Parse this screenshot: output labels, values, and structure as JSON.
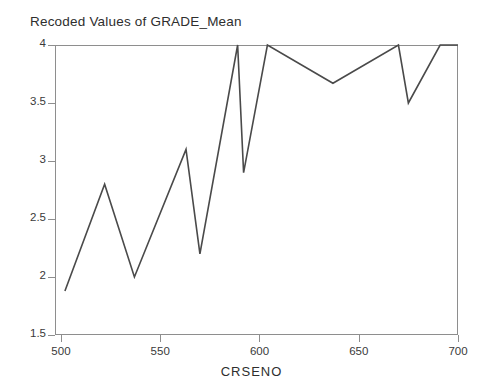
{
  "chart_data": {
    "type": "line",
    "title": "Recoded Values of GRADE_Mean",
    "xlabel": "CRSENO",
    "ylabel": "",
    "xlim": [
      497,
      700
    ],
    "ylim": [
      1.5,
      4.0
    ],
    "grid": false,
    "legend": false,
    "legend_position": "none",
    "line_color": "#4a4a4a",
    "xticks": [
      500,
      550,
      600,
      650,
      700
    ],
    "xtick_labels": [
      "500",
      "550",
      "600",
      "650",
      "700"
    ],
    "yticks": [
      1.5,
      2,
      2.5,
      3,
      3.5,
      4
    ],
    "ytick_labels": [
      "1.5",
      "2",
      "2.5",
      "3",
      "3.5",
      "4"
    ],
    "x": [
      502,
      522,
      537,
      563,
      570,
      589,
      592,
      604,
      637,
      670,
      675,
      691,
      700
    ],
    "y": [
      1.88,
      2.8,
      2.0,
      3.1,
      2.2,
      4.0,
      2.9,
      4.0,
      3.67,
      4.0,
      3.5,
      4.0,
      4.0
    ],
    "points": [
      {
        "x": 502,
        "y": 1.88
      },
      {
        "x": 522,
        "y": 2.8
      },
      {
        "x": 537,
        "y": 2.0
      },
      {
        "x": 563,
        "y": 3.1
      },
      {
        "x": 570,
        "y": 2.2
      },
      {
        "x": 589,
        "y": 4.0
      },
      {
        "x": 592,
        "y": 2.9
      },
      {
        "x": 604,
        "y": 4.0
      },
      {
        "x": 637,
        "y": 3.67
      },
      {
        "x": 670,
        "y": 4.0
      },
      {
        "x": 675,
        "y": 3.5
      },
      {
        "x": 691,
        "y": 4.0
      },
      {
        "x": 700,
        "y": 4.0
      }
    ],
    "series": [
      {
        "name": "Recoded Values of GRADE_Mean",
        "values": [
          1.88,
          2.8,
          2.0,
          3.1,
          2.2,
          4.0,
          2.9,
          4.0,
          3.67,
          4.0,
          3.5,
          4.0,
          4.0
        ]
      }
    ]
  }
}
